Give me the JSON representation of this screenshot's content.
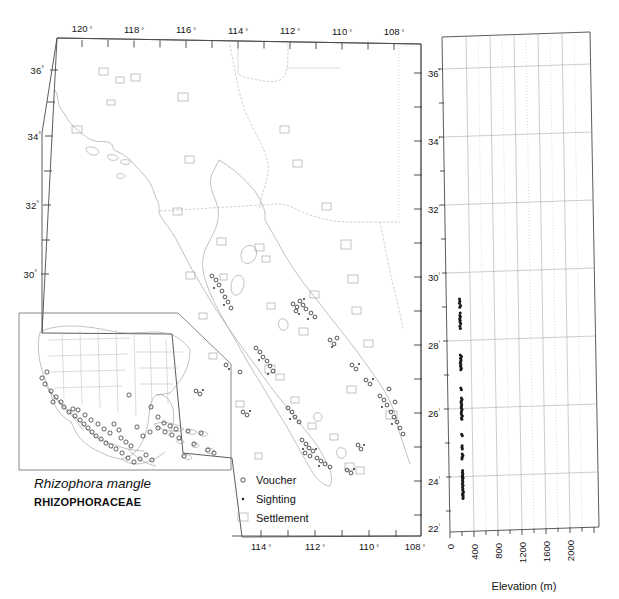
{
  "figure": {
    "species_name": "Rhizophora mangle",
    "family": "RHIZOPHORACEAE"
  },
  "legend": {
    "items": [
      {
        "symbol": "open-circle",
        "label": "Voucher"
      },
      {
        "symbol": "filled-dot",
        "label": "Sighting"
      },
      {
        "symbol": "open-square",
        "label": "Settlement"
      }
    ]
  },
  "main_map": {
    "top_axis_label_suffix": "°",
    "top_longitude_ticks": [
      "120",
      "118",
      "116",
      "114",
      "112",
      "110",
      "108"
    ],
    "bottom_longitude_ticks": [
      "114",
      "112",
      "110",
      "108"
    ],
    "left_latitude_ticks": [
      "36",
      "34",
      "32",
      "30"
    ],
    "right_latitude_ticks": [
      "36",
      "34",
      "32",
      "30",
      "28",
      "26",
      "24",
      "22"
    ],
    "degree_symbol": "°"
  },
  "chart_data": {
    "type": "scatter",
    "title": "",
    "xlabel": "Elevation (m)",
    "ylabel": "",
    "xlim": [
      -200,
      2100
    ],
    "ylim": [
      22,
      37
    ],
    "xticks": [
      0,
      400,
      800,
      1200,
      1600,
      2000
    ],
    "xtick_labels": [
      "0",
      "400",
      "800",
      "1200",
      "1600",
      "2000"
    ],
    "yticks": [
      22,
      24,
      26,
      28,
      30,
      32,
      34,
      36
    ],
    "ytick_labels": [
      "22°",
      "24°",
      "26°",
      "28°",
      "30°",
      "32°",
      "34°",
      "36°"
    ],
    "grid": true,
    "legend_position": "none",
    "series": [
      {
        "name": "Rhizophora mangle occurrences",
        "x": [
          5,
          10,
          4,
          20,
          8,
          12,
          6,
          15,
          3,
          9,
          7,
          18,
          5,
          11,
          4,
          22,
          6,
          14,
          8,
          2,
          10,
          5,
          16,
          7,
          3,
          12,
          9,
          20,
          6,
          4,
          13,
          8,
          5,
          17,
          10,
          3,
          7,
          21,
          6,
          11,
          4,
          15,
          9,
          5,
          12,
          8,
          19,
          6,
          3,
          10,
          7,
          14,
          5,
          9,
          4,
          16,
          8,
          6,
          11,
          3,
          13,
          5,
          10,
          7,
          18,
          4,
          9,
          6,
          12,
          8
        ],
        "y": [
          29.05,
          28.98,
          28.92,
          28.85,
          28.8,
          28.62,
          28.55,
          28.5,
          28.45,
          28.4,
          28.35,
          28.3,
          28.22,
          28.15,
          27.35,
          27.3,
          27.25,
          27.2,
          27.15,
          27.1,
          27.05,
          27.0,
          26.95,
          26.9,
          26.35,
          26.3,
          26.05,
          26.0,
          25.95,
          25.9,
          25.85,
          25.8,
          25.75,
          25.7,
          25.65,
          25.6,
          25.55,
          25.5,
          25.45,
          25.4,
          24.95,
          24.9,
          24.6,
          24.55,
          24.5,
          24.35,
          24.3,
          24.25,
          24.2,
          23.85,
          23.8,
          23.75,
          23.7,
          23.68,
          23.65,
          23.62,
          23.6,
          23.55,
          23.5,
          23.45,
          23.4,
          23.35,
          23.3,
          23.25,
          23.2,
          23.15,
          23.12,
          23.1,
          23.05,
          23.0
        ]
      }
    ]
  }
}
